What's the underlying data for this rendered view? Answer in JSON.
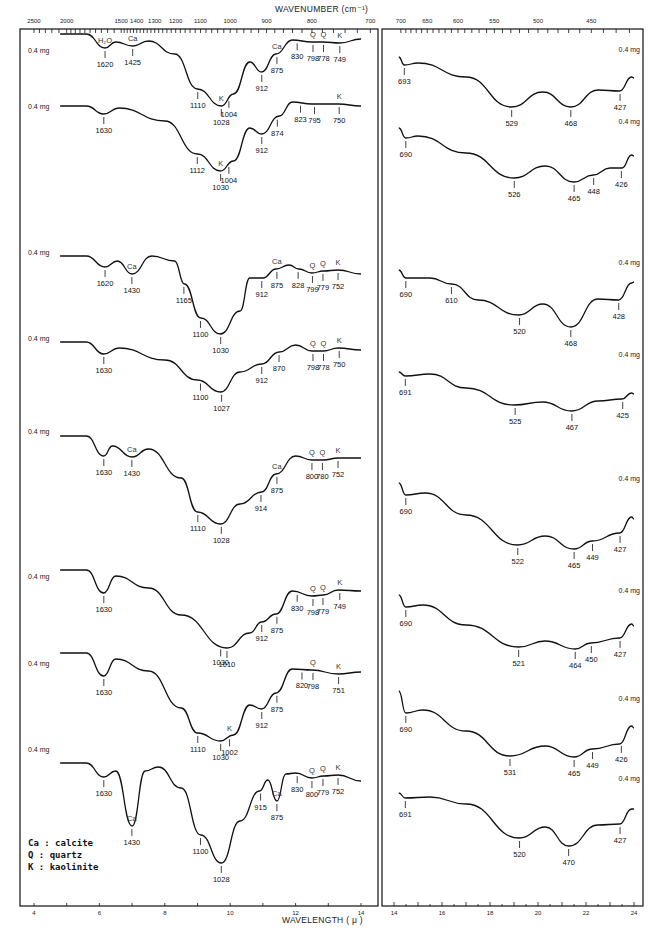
{
  "chart_data": {
    "type": "line",
    "title": "",
    "top_axis": {
      "label": "WAVENUMBER (cm⁻¹)",
      "left_ticks": [
        "2500",
        "2000",
        "1500",
        "1400",
        "1300",
        "1200",
        "1100",
        "1000",
        "900",
        "800",
        "700"
      ],
      "right_ticks": [
        "700",
        "650",
        "600",
        "550",
        "500",
        "450"
      ]
    },
    "bottom_axis": {
      "label": "WAVELENGTH ( μ )",
      "left_ticks": [
        4,
        6,
        8,
        10,
        12,
        14
      ],
      "right_ticks": [
        14,
        16,
        18,
        20,
        22,
        24
      ]
    },
    "legend": [
      {
        "abbr": "Ca",
        "text": "Ca : calcite"
      },
      {
        "abbr": "Q",
        "text": "Q  : quartz"
      },
      {
        "abbr": "K",
        "text": "K  : kaolinite"
      }
    ],
    "series": [
      {
        "name": "Spectrum 1",
        "mass": "0.4 mg",
        "left_peaks": [
          {
            "cm": 1620,
            "tag": "H2O"
          },
          {
            "cm": 1425,
            "tag": "Ca"
          },
          {
            "cm": 1110
          },
          {
            "cm": 1028,
            "tag": "K"
          },
          {
            "cm": 1004
          },
          {
            "cm": 912
          },
          {
            "cm": 875,
            "tag": "Ca"
          },
          {
            "cm": 830
          },
          {
            "cm": 798,
            "tag": "Q"
          },
          {
            "cm": 778,
            "tag": "Q"
          },
          {
            "cm": 749,
            "tag": "K"
          }
        ],
        "right_peaks": [
          693,
          529,
          468,
          427
        ]
      },
      {
        "name": "Spectrum 2",
        "mass": "0.4 mg",
        "left_peaks": [
          {
            "cm": 1630
          },
          {
            "cm": 1112
          },
          {
            "cm": 1030,
            "tag": "K"
          },
          {
            "cm": 1004
          },
          {
            "cm": 912
          },
          {
            "cm": 874
          },
          {
            "cm": 823
          },
          {
            "cm": 795
          },
          {
            "cm": 750,
            "tag": "K"
          }
        ],
        "right_peaks": [
          690,
          526,
          465,
          448,
          426
        ]
      },
      {
        "name": "Spectrum 3",
        "mass": "0.4 mg",
        "left_peaks": [
          {
            "cm": 1620
          },
          {
            "cm": 1430,
            "tag": "Ca"
          },
          {
            "cm": 1165
          },
          {
            "cm": 1100
          },
          {
            "cm": 1030
          },
          {
            "cm": 912
          },
          {
            "cm": 875,
            "tag": "Ca"
          },
          {
            "cm": 828
          },
          {
            "cm": 799,
            "tag": "Q"
          },
          {
            "cm": 779,
            "tag": "Q"
          },
          {
            "cm": 752,
            "tag": "K"
          }
        ],
        "right_peaks": [
          690,
          610,
          520,
          468,
          428
        ]
      },
      {
        "name": "Spectrum 4",
        "mass": "0.4 mg",
        "left_peaks": [
          {
            "cm": 1630
          },
          {
            "cm": 1100
          },
          {
            "cm": 1027
          },
          {
            "cm": 912
          },
          {
            "cm": 870
          },
          {
            "cm": 798,
            "tag": "Q"
          },
          {
            "cm": 778,
            "tag": "Q"
          },
          {
            "cm": 750,
            "tag": "K"
          }
        ],
        "right_peaks": [
          691,
          525,
          467,
          425
        ]
      },
      {
        "name": "Spectrum 5",
        "mass": "0.4 mg",
        "left_peaks": [
          {
            "cm": 1630
          },
          {
            "cm": 1430,
            "tag": "Ca"
          },
          {
            "cm": 1110
          },
          {
            "cm": 1028
          },
          {
            "cm": 914
          },
          {
            "cm": 875,
            "tag": "Ca"
          },
          {
            "cm": 800,
            "tag": "Q"
          },
          {
            "cm": 780,
            "tag": "Q"
          },
          {
            "cm": 752,
            "tag": "K"
          }
        ],
        "right_peaks": [
          690,
          522,
          465,
          449,
          427
        ]
      },
      {
        "name": "Spectrum 6",
        "mass": "0.4 mg",
        "left_peaks": [
          {
            "cm": 1630
          },
          {
            "cm": 1010
          },
          {
            "cm": 1030
          },
          {
            "cm": 912
          },
          {
            "cm": 875
          },
          {
            "cm": 830
          },
          {
            "cm": 798,
            "tag": "Q"
          },
          {
            "cm": 779,
            "tag": "Q"
          },
          {
            "cm": 749,
            "tag": "K"
          }
        ],
        "right_peaks": [
          690,
          521,
          464,
          450,
          427
        ]
      },
      {
        "name": "Spectrum 7",
        "mass": "0.4 mg",
        "left_peaks": [
          {
            "cm": 1630
          },
          {
            "cm": 1110
          },
          {
            "cm": 1030
          },
          {
            "cm": 1002,
            "tag": "K"
          },
          {
            "cm": 912
          },
          {
            "cm": 875
          },
          {
            "cm": 820
          },
          {
            "cm": 798,
            "tag": "Q"
          },
          {
            "cm": 751,
            "tag": "K"
          }
        ],
        "right_peaks": [
          690,
          531,
          465,
          449,
          426
        ]
      },
      {
        "name": "Spectrum 8",
        "mass": "0.4 mg",
        "left_peaks": [
          {
            "cm": 1630
          },
          {
            "cm": 1430,
            "tag": "Ca"
          },
          {
            "cm": 1100
          },
          {
            "cm": 1028
          },
          {
            "cm": 915
          },
          {
            "cm": 875,
            "tag": "Ca"
          },
          {
            "cm": 830
          },
          {
            "cm": 800,
            "tag": "Q"
          },
          {
            "cm": 779,
            "tag": "Q"
          },
          {
            "cm": 752,
            "tag": "K"
          }
        ],
        "right_peaks": [
          691,
          520,
          470,
          427
        ]
      }
    ]
  },
  "labels": {
    "top_axis_title": "WAVENUMBER (cm⁻¹)",
    "bottom_axis_title": "WAVELENGTH ( μ )",
    "mass": "0.4 mg",
    "legend_ca": "Ca : calcite",
    "legend_q": "Q  : quartz",
    "legend_k": "K  : kaolinite"
  }
}
